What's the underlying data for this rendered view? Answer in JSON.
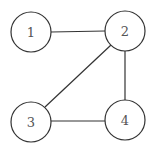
{
  "graph": {
    "nodes": [
      {
        "id": "1",
        "label": "1",
        "cx": 31,
        "cy": 32,
        "r": 20
      },
      {
        "id": "2",
        "label": "2",
        "cx": 125,
        "cy": 31,
        "r": 20
      },
      {
        "id": "3",
        "label": "3",
        "cx": 31,
        "cy": 122,
        "r": 20
      },
      {
        "id": "4",
        "label": "4",
        "cx": 125,
        "cy": 120,
        "r": 20
      }
    ],
    "edges": [
      {
        "from": "1",
        "to": "2"
      },
      {
        "from": "2",
        "to": "3"
      },
      {
        "from": "2",
        "to": "4"
      },
      {
        "from": "3",
        "to": "4"
      }
    ]
  }
}
